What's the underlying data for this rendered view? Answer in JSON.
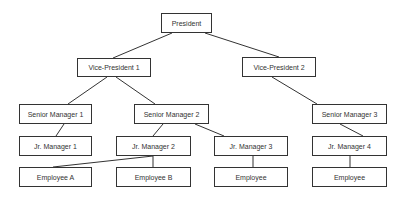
{
  "chart": {
    "nodes": [
      {
        "id": "president",
        "label": "President",
        "x": 161,
        "y": 13,
        "w": 51,
        "h": 20
      },
      {
        "id": "vp1",
        "label": "Vice-President 1",
        "x": 77,
        "y": 58,
        "w": 74,
        "h": 19
      },
      {
        "id": "vp2",
        "label": "Vice-President 2",
        "x": 242,
        "y": 57,
        "w": 74,
        "h": 20
      },
      {
        "id": "sm1",
        "label": "Senior Manager 1",
        "x": 19,
        "y": 104,
        "w": 73,
        "h": 20
      },
      {
        "id": "sm2",
        "label": "Senior Manager 2",
        "x": 134,
        "y": 104,
        "w": 75,
        "h": 20
      },
      {
        "id": "sm3",
        "label": "Senior Manager 3",
        "x": 312,
        "y": 104,
        "w": 75,
        "h": 20
      },
      {
        "id": "jm1",
        "label": "Jr. Manager 1",
        "x": 19,
        "y": 136,
        "w": 73,
        "h": 20
      },
      {
        "id": "jm2",
        "label": "Jr. Manager 2",
        "x": 116,
        "y": 136,
        "w": 75,
        "h": 20
      },
      {
        "id": "jm3",
        "label": "Jr. Manager 3",
        "x": 214,
        "y": 136,
        "w": 74,
        "h": 20
      },
      {
        "id": "jm4",
        "label": "Jr. Manager 4",
        "x": 312,
        "y": 136,
        "w": 75,
        "h": 20
      },
      {
        "id": "empA",
        "label": "Employee A",
        "x": 19,
        "y": 167,
        "w": 73,
        "h": 20
      },
      {
        "id": "empB",
        "label": "Employee B",
        "x": 116,
        "y": 167,
        "w": 75,
        "h": 20
      },
      {
        "id": "emp3",
        "label": "Employee",
        "x": 214,
        "y": 167,
        "w": 74,
        "h": 20
      },
      {
        "id": "emp4",
        "label": "Employee",
        "x": 312,
        "y": 167,
        "w": 75,
        "h": 20
      }
    ],
    "edges": [
      {
        "from": "president",
        "to": "vp1",
        "x1": 172,
        "y1": 33,
        "x2": 113,
        "y2": 58
      },
      {
        "from": "president",
        "to": "vp2",
        "x1": 205,
        "y1": 33,
        "x2": 279,
        "y2": 57
      },
      {
        "from": "vp1",
        "to": "sm1",
        "x1": 107,
        "y1": 77,
        "x2": 68,
        "y2": 104
      },
      {
        "from": "vp1",
        "to": "sm2",
        "x1": 116,
        "y1": 77,
        "x2": 155,
        "y2": 104
      },
      {
        "from": "vp2",
        "to": "sm3",
        "x1": 272,
        "y1": 77,
        "x2": 317,
        "y2": 104
      },
      {
        "from": "sm1",
        "to": "jm1",
        "x1": 64,
        "y1": 124,
        "x2": 56,
        "y2": 136
      },
      {
        "from": "sm2",
        "to": "jm2",
        "x1": 163,
        "y1": 124,
        "x2": 153,
        "y2": 136
      },
      {
        "from": "sm2",
        "to": "jm3",
        "x1": 195,
        "y1": 124,
        "x2": 224,
        "y2": 136
      },
      {
        "from": "sm3",
        "to": "jm4",
        "x1": 340,
        "y1": 124,
        "x2": 363,
        "y2": 136
      },
      {
        "from": "jm2",
        "to": "empA",
        "x1": 153,
        "y1": 156,
        "x2": 53,
        "y2": 167
      },
      {
        "from": "jm2",
        "to": "empB",
        "x1": 153,
        "y1": 156,
        "x2": 153,
        "y2": 167
      },
      {
        "from": "jm3",
        "to": "emp3",
        "x1": 253,
        "y1": 156,
        "x2": 253,
        "y2": 167
      },
      {
        "from": "jm4",
        "to": "emp4",
        "x1": 350,
        "y1": 156,
        "x2": 350,
        "y2": 167
      }
    ],
    "colors": {
      "line": "#333333",
      "border": "#333333",
      "text": "#333333",
      "background": "#ffffff"
    }
  }
}
